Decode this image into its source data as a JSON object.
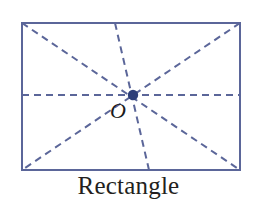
{
  "figure": {
    "caption": "Rectangle",
    "center_label": "O",
    "shape_type": "rectangle",
    "colors": {
      "outline": "#5b6699",
      "dashed_line": "#5b6699",
      "center_dot": "#2e3f79",
      "caption_text": "#231f20",
      "background": "#ffffff"
    },
    "rectangle": {
      "left": 22,
      "top": 23,
      "right": 240,
      "bottom": 170,
      "width": 218,
      "height": 147,
      "stroke_width": 2
    },
    "center_point": {
      "x": 133,
      "y": 95,
      "radius": 5
    },
    "dashed_lines": [
      {
        "name": "diagonal-top-left-to-bottom-right",
        "x1": 22,
        "y1": 23,
        "x2": 240,
        "y2": 170
      },
      {
        "name": "diagonal-top-right-to-bottom-left",
        "x1": 240,
        "y1": 23,
        "x2": 22,
        "y2": 170
      },
      {
        "name": "horizontal-midline",
        "x1": 22,
        "y1": 95,
        "x2": 240,
        "y2": 95
      },
      {
        "name": "near-vertical-line",
        "x1": 115,
        "y1": 23,
        "x2": 149,
        "y2": 170
      }
    ],
    "dash_pattern": "7 5"
  }
}
